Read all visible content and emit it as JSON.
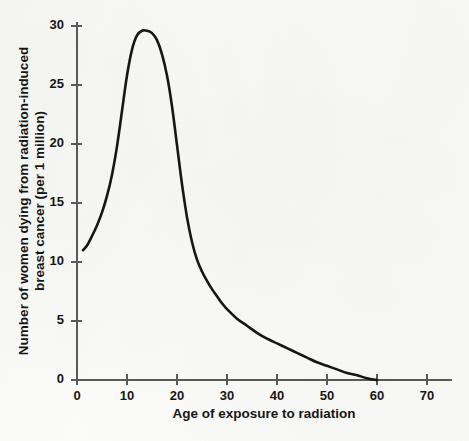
{
  "figure": {
    "background_color": "#fbfbf9",
    "curve_color": "#161616",
    "axis_color": "#595959"
  },
  "chart_data": {
    "type": "line",
    "title": "",
    "subtitle": "",
    "xlabel": "Age of exposure to radiation",
    "ylabel": "Number of women dying from radiation-induced breast cancer (per 1 million)",
    "ylabel_line1": "Number of women dying from radiation-induced",
    "ylabel_line2": "breast cancer (per 1 million)",
    "xlim": [
      0,
      75
    ],
    "ylim": [
      0,
      30
    ],
    "xticks": [
      0,
      10,
      20,
      30,
      40,
      50,
      60,
      70
    ],
    "xticklabels": [
      "0",
      "10",
      "20",
      "30",
      "40",
      "50",
      "60",
      "70"
    ],
    "yticks": [
      0,
      5,
      10,
      15,
      20,
      25,
      30
    ],
    "yticklabels": [
      "0",
      "5",
      "10",
      "15",
      "20",
      "25",
      "30"
    ],
    "grid": false,
    "legend": null,
    "legend_position": "none",
    "annotations": [],
    "series": [
      {
        "name": "Radiation-induced breast cancer deaths",
        "x": [
          1.2,
          2,
          3,
          4,
          5,
          6,
          7,
          8,
          9,
          10,
          11,
          12,
          13,
          14,
          15,
          16,
          17,
          18,
          19,
          20,
          21,
          22,
          23,
          24,
          25,
          26,
          27,
          28,
          29,
          30,
          32,
          34,
          36,
          38,
          40,
          42,
          44,
          46,
          48,
          50,
          52,
          54,
          56,
          58,
          60
        ],
        "values": [
          11.0,
          11.4,
          12.2,
          13.1,
          14.2,
          15.6,
          17.4,
          19.8,
          22.8,
          25.8,
          28.0,
          29.2,
          29.6,
          29.6,
          29.4,
          28.8,
          27.6,
          25.8,
          23.2,
          19.9,
          16.6,
          13.8,
          11.7,
          10.2,
          9.2,
          8.4,
          7.7,
          7.1,
          6.5,
          6.0,
          5.2,
          4.6,
          4.0,
          3.5,
          3.1,
          2.7,
          2.3,
          1.9,
          1.5,
          1.2,
          0.9,
          0.6,
          0.4,
          0.15,
          0.0
        ]
      }
    ],
    "peak": {
      "x": 14,
      "y": 29.6
    },
    "curve_start": {
      "x": 1.2,
      "y": 11.0
    },
    "curve_end": {
      "x": 60,
      "y": 0.0
    }
  }
}
